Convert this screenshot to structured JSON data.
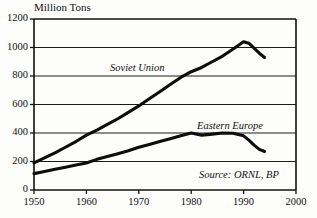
{
  "chart_data": {
    "type": "line",
    "title": "Million Tons",
    "xlabel": "",
    "ylabel": "Million Tons",
    "xlim": [
      1950,
      2000
    ],
    "ylim": [
      0,
      1200
    ],
    "xticks": [
      1950,
      1960,
      1970,
      1980,
      1990,
      2000
    ],
    "yticks": [
      0,
      200,
      400,
      600,
      800,
      1000,
      1200
    ],
    "xtick_labels": [
      "1950",
      "1960",
      "1970",
      "1980",
      "1990",
      "2000"
    ],
    "ytick_labels": [
      "0",
      "200",
      "400",
      "600",
      "800",
      "1000",
      "1200"
    ],
    "grid": "horizontal",
    "legend_position": "inline-annotations",
    "annotations": [
      {
        "text": "Soviet Union",
        "x": 1965,
        "y": 860,
        "style": "italic"
      },
      {
        "text": "Eastern Europe",
        "x": 1981,
        "y": 470,
        "style": "italic"
      },
      {
        "text": "Source: ORNL, BP",
        "x": 1996,
        "y": 120,
        "style": "italic"
      }
    ],
    "series": [
      {
        "name": "Soviet Union",
        "x": [
          1950,
          1952,
          1954,
          1956,
          1958,
          1960,
          1962,
          1964,
          1966,
          1968,
          1970,
          1972,
          1974,
          1976,
          1978,
          1980,
          1982,
          1984,
          1986,
          1988,
          1990,
          1991,
          1992,
          1993,
          1994
        ],
        "values": [
          190,
          225,
          260,
          300,
          340,
          385,
          420,
          460,
          500,
          545,
          590,
          640,
          690,
          740,
          790,
          830,
          860,
          900,
          940,
          990,
          1040,
          1030,
          995,
          960,
          930
        ]
      },
      {
        "name": "Eastern Europe",
        "x": [
          1950,
          1952,
          1954,
          1956,
          1958,
          1960,
          1962,
          1964,
          1966,
          1968,
          1970,
          1972,
          1974,
          1976,
          1978,
          1980,
          1982,
          1984,
          1986,
          1988,
          1990,
          1991,
          1992,
          1993,
          1994
        ],
        "values": [
          115,
          130,
          145,
          160,
          175,
          190,
          215,
          235,
          255,
          275,
          300,
          320,
          340,
          360,
          380,
          400,
          385,
          392,
          400,
          398,
          380,
          350,
          315,
          285,
          270
        ]
      }
    ]
  },
  "figure": {
    "axis_title": "Million Tons",
    "source_note": "Source: ORNL, BP",
    "series_labels": {
      "soviet_union": "Soviet Union",
      "eastern_europe": "Eastern Europe"
    }
  }
}
